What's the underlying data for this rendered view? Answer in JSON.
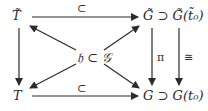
{
  "diagram": {
    "type": "commutative-diagram",
    "nodes": {
      "top_left": "T̃",
      "bottom_left": "T",
      "top_right": "G̃ ⊃ G̃(t̃₀)",
      "bottom_right": "G ⊃ G(t₀)",
      "center": "𝔥 ⊂ 𝒢"
    },
    "edge_labels": {
      "top_horizontal": "⊂",
      "bottom_horizontal": "⊂",
      "right_vertical_1": "π",
      "right_vertical_2": "≅"
    },
    "edges": [
      {
        "from": "top_left",
        "to": "top_right",
        "label": "⊂"
      },
      {
        "from": "bottom_left",
        "to": "bottom_right",
        "label": "⊂"
      },
      {
        "from": "top_left",
        "to": "bottom_left",
        "label": ""
      },
      {
        "from": "top_right",
        "to": "bottom_right",
        "label": "π"
      },
      {
        "from": "top_right",
        "to": "bottom_right",
        "label": "≅"
      },
      {
        "from": "center",
        "to": "top_left",
        "label": ""
      },
      {
        "from": "center",
        "to": "top_right",
        "label": ""
      },
      {
        "from": "center",
        "to": "bottom_left",
        "label": ""
      },
      {
        "from": "center",
        "to": "bottom_right",
        "label": ""
      }
    ],
    "colors": {
      "ink": "#2b2b2b",
      "background": "#ffffff"
    }
  }
}
